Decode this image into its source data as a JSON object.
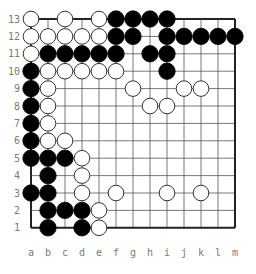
{
  "board": {
    "size": 13,
    "colors": {
      "line": "#555555",
      "edge": "#222222",
      "black": "#000000",
      "white": "#ffffff",
      "label": "#7a7a7a"
    },
    "column_labels": [
      "a",
      "b",
      "c",
      "d",
      "e",
      "f",
      "g",
      "h",
      "i",
      "j",
      "k",
      "l",
      "m"
    ],
    "row_labels": [
      "13",
      "12",
      "11",
      "10",
      "9",
      "8",
      "7",
      "6",
      "5",
      "4",
      "3",
      "2",
      "1"
    ],
    "stones": {
      "black": [
        "f13",
        "g13",
        "h13",
        "i13",
        "f12",
        "g12",
        "i12",
        "j12",
        "k12",
        "l12",
        "m12",
        "b11",
        "c11",
        "d11",
        "e11",
        "f11",
        "h11",
        "i11",
        "a10",
        "i10",
        "a9",
        "a8",
        "a7",
        "a6",
        "a5",
        "b5",
        "c5",
        "b4",
        "a3",
        "b3",
        "b2",
        "c2",
        "d2",
        "b1",
        "d1"
      ],
      "white": [
        "a13",
        "c13",
        "e13",
        "a12",
        "b12",
        "c12",
        "d12",
        "e12",
        "a11",
        "b10",
        "c10",
        "d10",
        "e10",
        "f10",
        "b9",
        "g9",
        "j9",
        "k9",
        "h8",
        "i8",
        "b8",
        "b7",
        "b6",
        "c6",
        "d5",
        "d4",
        "d3",
        "f3",
        "i3",
        "k3",
        "e2",
        "e1"
      ]
    }
  }
}
